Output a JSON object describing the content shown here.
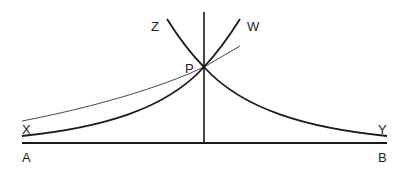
{
  "diagram": {
    "labels": {
      "A": "A",
      "B": "B",
      "X": "X",
      "Y": "Y",
      "Z": "Z",
      "W": "W",
      "P": "P"
    },
    "colors": {
      "stroke": "#1a1a1a",
      "background": "#ffffff"
    },
    "elements": [
      {
        "id": "baseline-AB",
        "type": "line",
        "from": "A",
        "to": "B"
      },
      {
        "id": "vertical-axis",
        "type": "line",
        "through": "P"
      },
      {
        "id": "curve-X-P-W",
        "type": "curve",
        "from": "X",
        "through": "P",
        "to": "W"
      },
      {
        "id": "curve-Z-P-Y",
        "type": "curve",
        "from": "Z",
        "through": "P",
        "to": "Y"
      },
      {
        "id": "tangent-line",
        "type": "thin-curve",
        "touches": "P"
      }
    ]
  }
}
